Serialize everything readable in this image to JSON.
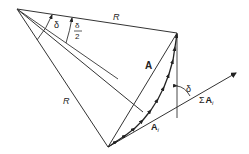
{
  "diagram": {
    "labels": {
      "radius_top": "R",
      "radius_left": "R",
      "angle_delta": "δ",
      "angle_half_num": "δ",
      "angle_half_den": "2",
      "chord": "A",
      "element": "A",
      "element_sub": "i",
      "sum_sigma": "Σ",
      "sum_vec": "A",
      "sum_sub": "i",
      "angle_delta_right": "δ"
    },
    "colors": {
      "line": "#333333",
      "background": "#ffffff"
    }
  }
}
